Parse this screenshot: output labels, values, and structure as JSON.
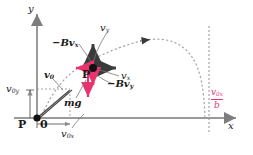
{
  "figure": {
    "type": "physics-diagram",
    "axes": {
      "x_label": "x",
      "y_label": "y",
      "origin_label": "0"
    },
    "colors": {
      "accent_red": "#e8336e",
      "ink": "#1a1a1a",
      "axis": "#9a9a9a",
      "dashed": "#9a9a9a"
    }
  },
  "labels": {
    "y_axis": "y",
    "x_axis": "x",
    "origin_point": "P",
    "origin_zero": "0",
    "particle_point": "P",
    "v_y": "v",
    "v_y_sub": "y",
    "v_x": "v",
    "v_x_sub": "x",
    "drag_x": "−Bv",
    "drag_x_sub": "x",
    "drag_y": "−Bv",
    "drag_y_sub": "y",
    "weight": "mg",
    "v0": "v",
    "v0_sub": "0",
    "v0y": "v",
    "v0y_sub": "0y",
    "v0x": "v",
    "v0x_sub": "0x",
    "asymptote_num": "v",
    "asymptote_num_sub": "0x",
    "asymptote_den": "b"
  }
}
